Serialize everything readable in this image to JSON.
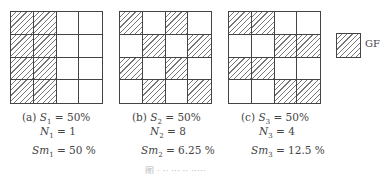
{
  "panels": [
    {
      "id": "a",
      "label": "(a)",
      "S_label": "S",
      "S_sub": "1",
      "S_value": "= 50%",
      "N_label": "N",
      "N_sub": "1",
      "N_value": "= 1",
      "Sm_label": "Sm",
      "Sm_sub": "1",
      "Sm_value": "= 50 %",
      "hatched": [
        [
          1,
          1,
          0,
          0
        ],
        [
          1,
          1,
          0,
          0
        ],
        [
          1,
          1,
          0,
          0
        ],
        [
          1,
          1,
          0,
          0
        ]
      ]
    },
    {
      "id": "b",
      "label": "(b)",
      "S_label": "S",
      "S_sub": "2",
      "S_value": "= 50%",
      "N_label": "N",
      "N_sub": "2",
      "N_value": "= 8",
      "Sm_label": "Sm",
      "Sm_sub": "2",
      "Sm_value": "= 6.25 %",
      "hatched": [
        [
          1,
          0,
          1,
          0
        ],
        [
          0,
          1,
          0,
          1
        ],
        [
          1,
          0,
          1,
          0
        ],
        [
          0,
          1,
          0,
          1
        ]
      ]
    },
    {
      "id": "c",
      "label": "(c)",
      "S_label": "S",
      "S_sub": "3",
      "S_value": "= 50%",
      "N_label": "N",
      "N_sub": "3",
      "N_value": "= 4",
      "Sm_label": "Sm",
      "Sm_sub": "3",
      "Sm_value": "= 12.5 %",
      "hatched": [
        [
          1,
          1,
          0,
          0
        ],
        [
          0,
          0,
          1,
          1
        ],
        [
          1,
          1,
          0,
          0
        ],
        [
          0,
          0,
          1,
          1
        ]
      ]
    }
  ],
  "legend": {
    "label": "GF",
    "icon": "hatched-square"
  },
  "caption": "图 ·  ·· ··· ·· ·····"
}
